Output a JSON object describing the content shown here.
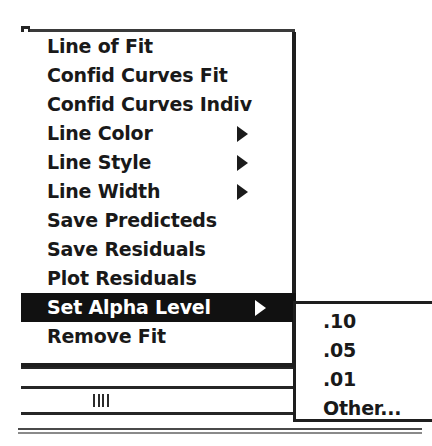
{
  "menu": {
    "title": "Fit",
    "items": [
      {
        "label": "Line of Fit",
        "has_submenu": false,
        "selected": false
      },
      {
        "label": "Confid Curves Fit",
        "has_submenu": false,
        "selected": false
      },
      {
        "label": "Confid Curves Indiv",
        "has_submenu": false,
        "selected": false
      },
      {
        "label": "Line Color",
        "has_submenu": true,
        "selected": false
      },
      {
        "label": "Line Style",
        "has_submenu": true,
        "selected": false
      },
      {
        "label": "Line Width",
        "has_submenu": true,
        "selected": false
      },
      {
        "label": "Save Predicteds",
        "has_submenu": false,
        "selected": false
      },
      {
        "label": "Save Residuals",
        "has_submenu": false,
        "selected": false
      },
      {
        "label": "Plot Residuals",
        "has_submenu": false,
        "selected": false
      },
      {
        "label": "Set Alpha Level",
        "has_submenu": true,
        "selected": true
      },
      {
        "label": "Remove Fit",
        "has_submenu": false,
        "selected": false
      }
    ]
  },
  "submenu": {
    "parent": "Set Alpha Level",
    "items": [
      {
        "label": ".10"
      },
      {
        "label": ".05"
      },
      {
        "label": ".01"
      },
      {
        "label": "Other..."
      }
    ]
  },
  "window": {
    "scrollbar": {
      "orientation": "horizontal",
      "grip": "||||"
    }
  },
  "colors": {
    "menu_background": "#ffffff",
    "menu_text": "#191919",
    "highlight_background": "#111111",
    "highlight_text": "#ffffff",
    "border": "#1e1e1e"
  }
}
